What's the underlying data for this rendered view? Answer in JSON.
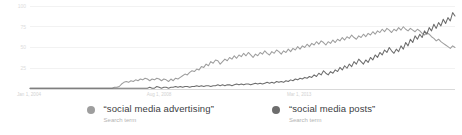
{
  "chart_data": {
    "type": "line",
    "title": "",
    "subtitle": "",
    "xlabel": "",
    "ylabel": "",
    "ylim": [
      0,
      100
    ],
    "grid": true,
    "legend_position": "bottom",
    "yticks": [
      "100",
      "75",
      "50",
      "25"
    ],
    "ytick_values": [
      100,
      75,
      50,
      25
    ],
    "xticks": [
      "Jan 1, 2004",
      "Aug 1, 2008",
      "Mar 1, 2013"
    ],
    "xtick_positions": [
      0,
      0.305,
      0.635
    ],
    "series": [
      {
        "name": "“social media advertising”",
        "sublabel": "Search term",
        "color": "#9e9e9e",
        "values": [
          1,
          1,
          1,
          1,
          1,
          1,
          1,
          1,
          1,
          1,
          1,
          1,
          1,
          1,
          1,
          1,
          1,
          1,
          1,
          1,
          1,
          1,
          1,
          1,
          1,
          1,
          1,
          1,
          1,
          1,
          1,
          1,
          1,
          1,
          1,
          1,
          2,
          2,
          3,
          6,
          8,
          9,
          8,
          10,
          9,
          11,
          10,
          12,
          11,
          13,
          12,
          10,
          12,
          11,
          13,
          12,
          10,
          12,
          11,
          9,
          12,
          10,
          13,
          12,
          14,
          16,
          18,
          17,
          20,
          22,
          21,
          24,
          23,
          27,
          26,
          30,
          28,
          33,
          31,
          35,
          34,
          30,
          33,
          36,
          34,
          38,
          36,
          40,
          37,
          41,
          39,
          43,
          40,
          44,
          41,
          38,
          42,
          40,
          44,
          42,
          46,
          43,
          41,
          45,
          43,
          47,
          45,
          42,
          46,
          44,
          48,
          45,
          49,
          47,
          51,
          48,
          52,
          50,
          54,
          51,
          55,
          53,
          57,
          54,
          58,
          56,
          53,
          57,
          55,
          59,
          56,
          60,
          58,
          62,
          59,
          63,
          61,
          65,
          62,
          60,
          64,
          62,
          66,
          63,
          67,
          65,
          69,
          66,
          70,
          68,
          72,
          69,
          73,
          71,
          68,
          72,
          70,
          74,
          71,
          75,
          72,
          70,
          73,
          71,
          69,
          72,
          70,
          67,
          65,
          68,
          66,
          63,
          61,
          58,
          60,
          57,
          55,
          53,
          51,
          49,
          52,
          50
        ]
      },
      {
        "name": "“social media posts”",
        "sublabel": "Search term",
        "color": "#6d6d6d",
        "values": [
          1,
          1,
          1,
          1,
          1,
          1,
          1,
          1,
          1,
          1,
          1,
          1,
          1,
          1,
          1,
          1,
          1,
          1,
          1,
          1,
          1,
          1,
          1,
          1,
          1,
          1,
          1,
          1,
          1,
          1,
          1,
          1,
          1,
          1,
          1,
          1,
          1,
          1,
          1,
          1,
          1,
          1,
          1,
          1,
          1,
          1,
          1,
          1,
          1,
          1,
          1,
          2,
          1,
          1,
          3,
          2,
          1,
          2,
          2,
          1,
          2,
          2,
          3,
          2,
          3,
          2,
          3,
          3,
          2,
          3,
          3,
          4,
          3,
          4,
          3,
          4,
          4,
          3,
          4,
          4,
          5,
          4,
          5,
          4,
          5,
          5,
          4,
          5,
          6,
          5,
          6,
          5,
          6,
          6,
          5,
          6,
          7,
          6,
          7,
          6,
          7,
          8,
          7,
          8,
          7,
          9,
          8,
          9,
          8,
          10,
          9,
          11,
          10,
          12,
          11,
          13,
          12,
          14,
          13,
          15,
          14,
          17,
          15,
          19,
          17,
          22,
          19,
          17,
          21,
          19,
          23,
          21,
          26,
          23,
          28,
          25,
          30,
          27,
          33,
          30,
          36,
          33,
          30,
          35,
          32,
          38,
          35,
          41,
          38,
          44,
          41,
          47,
          44,
          50,
          46,
          43,
          48,
          45,
          52,
          48,
          56,
          52,
          60,
          56,
          64,
          60,
          66,
          62,
          70,
          66,
          74,
          70,
          78,
          73,
          80,
          76,
          84,
          79,
          86,
          82,
          92,
          88
        ]
      }
    ]
  },
  "legend": {
    "entries": [
      {
        "term": "“social media advertising”",
        "sublabel": "Search term",
        "dot_color": "#9e9e9e"
      },
      {
        "term": "“social media posts”",
        "sublabel": "Search term",
        "dot_color": "#6d6d6d"
      }
    ]
  },
  "colors": {
    "series_advertising": "#9e9e9e",
    "series_posts": "#6d6d6d",
    "gridline": "#ececec",
    "axis": "#cfcfcf",
    "tick_text": "#d6d6d6",
    "legend_term_text": "#3c4043",
    "legend_sub_text": "#b4b4b4",
    "background": "#ffffff"
  }
}
